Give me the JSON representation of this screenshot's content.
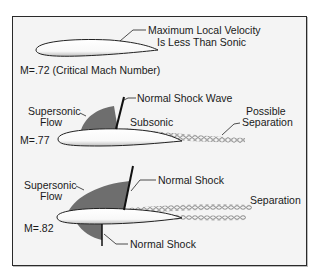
{
  "diagram": {
    "colors": {
      "background": "#f4f4f4",
      "border": "#2a2a2a",
      "supersonic_region": "#6e6e6e",
      "shock_line": "#111111",
      "airfoil_fill": "#ffffff",
      "text": "#1a1a1a"
    },
    "panels": [
      {
        "mach_label": "M=.72 (Critical Mach Number)",
        "callouts": [
          {
            "line1": "Maximum Local Velocity",
            "line2": "Is Less Than Sonic"
          }
        ]
      },
      {
        "mach_label": "M=.77",
        "callouts": [
          {
            "line1": "Supersonic",
            "line2": "Flow"
          },
          {
            "line1": "Normal Shock Wave"
          },
          {
            "line1": "Subsonic"
          },
          {
            "line1": "Possible",
            "line2": "Separation"
          }
        ]
      },
      {
        "mach_label": "M=.82",
        "callouts": [
          {
            "line1": "Supersonic",
            "line2": "Flow"
          },
          {
            "line1": "Normal Shock"
          },
          {
            "line1": "Separation"
          },
          {
            "line1": "Normal Shock"
          }
        ]
      }
    ]
  }
}
